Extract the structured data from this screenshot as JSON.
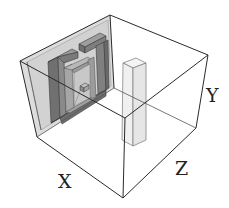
{
  "diagram": {
    "type": "3d-box-scene",
    "axes": {
      "x_label": "X",
      "y_label": "Y",
      "z_label": "Z"
    },
    "objects": [
      {
        "name": "back-wall",
        "description": "translucent gray wall panel"
      },
      {
        "name": "spiral",
        "description": "square spiral extrusion mounted on wall"
      },
      {
        "name": "pillar",
        "description": "tall translucent rectangular column"
      }
    ],
    "colors": {
      "edge": "#2a2a2a",
      "wall": "#d9d9d9",
      "spiral_dark": "#6e6e6e",
      "spiral_mid": "#8c8c8c",
      "spiral_light": "#b4b4b4",
      "pillar": "#f2f2f2"
    }
  }
}
